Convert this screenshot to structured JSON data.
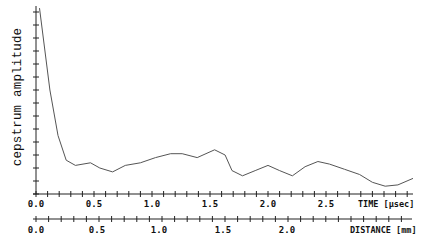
{
  "chart_data": {
    "type": "line",
    "title": "",
    "ylabel": "cepstrum amplitude",
    "xlabel": "TIME [µsec]",
    "secondary_xlabel": "DISTANCE [mm]",
    "xlim": [
      0.0,
      3.25
    ],
    "ylim": [
      0,
      14
    ],
    "y_ticks_count": 14,
    "x_ticks": [
      "0.0",
      "0.5",
      "1.0",
      "1.5",
      "2.0",
      "2.5"
    ],
    "x_tick_values": [
      0.0,
      0.5,
      1.0,
      1.5,
      2.0,
      2.5
    ],
    "secondary_x_ticks": [
      "0.0",
      "0.5",
      "1.0",
      "1.5",
      "2.0"
    ],
    "secondary_x_tick_values": [
      0.0,
      0.5,
      1.0,
      1.5,
      2.0
    ],
    "grid": false,
    "legend": null,
    "series": [
      {
        "name": "cepstrum",
        "x": [
          0.03,
          0.12,
          0.19,
          0.26,
          0.34,
          0.47,
          0.55,
          0.66,
          0.77,
          0.9,
          1.03,
          1.16,
          1.26,
          1.39,
          1.54,
          1.63,
          1.69,
          1.78,
          1.89,
          2.0,
          2.1,
          2.21,
          2.32,
          2.43,
          2.53,
          2.66,
          2.79,
          2.9,
          3.01,
          3.12,
          3.25
        ],
        "values": [
          14.3,
          8.0,
          4.5,
          2.6,
          2.2,
          2.4,
          2.0,
          1.7,
          2.2,
          2.4,
          2.8,
          3.1,
          3.1,
          2.8,
          3.4,
          3.0,
          1.8,
          1.4,
          1.8,
          2.2,
          1.8,
          1.4,
          2.1,
          2.5,
          2.3,
          1.9,
          1.5,
          0.9,
          0.6,
          0.7,
          1.2
        ]
      }
    ]
  },
  "labels": {
    "ylabel": "cepstrum amplitude",
    "time_axis_title": "TIME [µsec]",
    "distance_axis_title": "DISTANCE [mm]",
    "time_ticks": [
      "0.0",
      "0.5",
      "1.0",
      "1.5",
      "2.0",
      "2.5"
    ],
    "distance_ticks": [
      "0.0",
      "0.5",
      "1.0",
      "1.5",
      "2.0"
    ]
  },
  "colors": {
    "line": "#555555",
    "axis": "#222222",
    "text": "#111111",
    "background": "#ffffff"
  }
}
